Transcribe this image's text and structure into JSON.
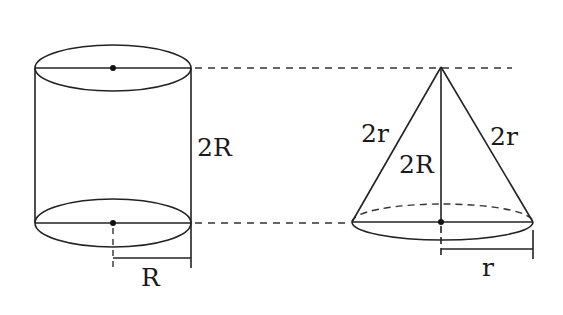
{
  "figure": {
    "cylinder": {
      "height_label": "2R",
      "radius_label": "R"
    },
    "cone": {
      "slant_left_label": "2r",
      "slant_right_label": "2r",
      "height_label": "2R",
      "radius_label": "r"
    },
    "colors": {
      "line": "#222222",
      "background": "#ffffff"
    }
  }
}
